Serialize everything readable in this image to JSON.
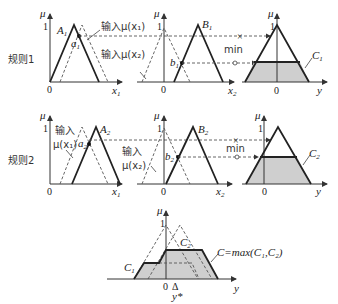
{
  "figure": {
    "rules": [
      {
        "label": "规则1",
        "input1": {
          "set": "A",
          "sub": "1",
          "point": "a",
          "point_sub": "1",
          "axis_x": "x",
          "axis_x_sub": "1",
          "annotation": "输入μ(x₁)"
        },
        "input2": {
          "set": "B",
          "sub": "1",
          "point": "b",
          "point_sub": "1",
          "axis_x": "x",
          "axis_x_sub": "2",
          "annotation": "输入μ(x₂)"
        },
        "output": {
          "set": "C",
          "sub": "1",
          "axis_x": "y"
        },
        "operator": "min"
      },
      {
        "label": "规则2",
        "input1": {
          "set": "A",
          "sub": "2",
          "point": "a",
          "point_sub": "2",
          "axis_x": "x",
          "axis_x_sub": "1",
          "annotation_line1": "输入",
          "annotation_line2": "μ(x₁)"
        },
        "input2": {
          "set": "B",
          "sub": "2",
          "point": "b",
          "point_sub": "2",
          "axis_x": "x",
          "axis_x_sub": "2",
          "annotation_line1": "输入",
          "annotation_line2": "μ(x₂)"
        },
        "output": {
          "set": "C",
          "sub": "2",
          "axis_x": "y"
        },
        "operator": "min"
      }
    ],
    "aggregate": {
      "formula": "C=max(C₁,C₂)",
      "c1_label": "C",
      "c1_sub": "1",
      "c2_label": "C",
      "c2_sub": "2",
      "axis_x": "y",
      "centroid": "y*",
      "centroid_marker": "Δ"
    },
    "axis_y": "μ",
    "tick_one": "1",
    "origin": "0",
    "firing_strength": {
      "rule1": 0.35,
      "rule2": 0.55
    }
  }
}
